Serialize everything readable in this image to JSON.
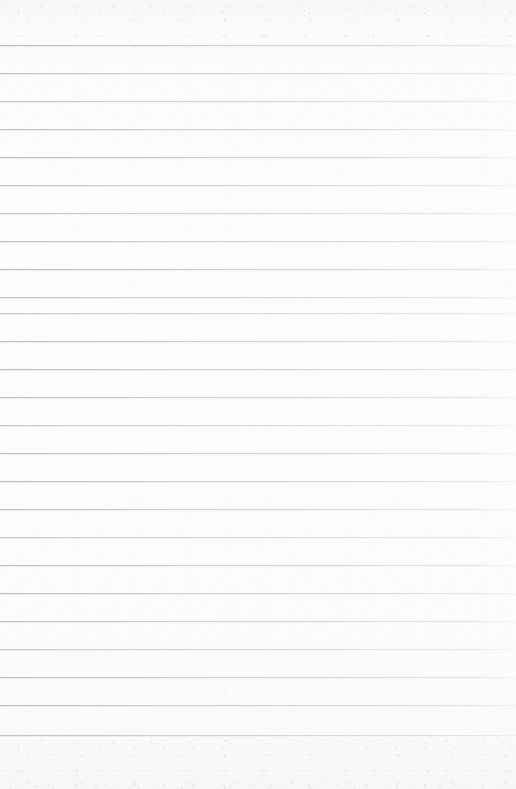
{
  "document": {
    "kind": "scanned-ruled-paper",
    "title": "Blank ruled notebook page",
    "text_content": "",
    "width": 516,
    "height": 789
  },
  "paper": {
    "background_color": "#fbfbfc",
    "edge_tint_color": "#f6f7f8",
    "has_texture": true,
    "texture_regions": [
      "top-margin",
      "bottom-margin"
    ]
  },
  "ruling": {
    "line_color": "#c5c9cd",
    "line_thickness_px": 1,
    "line_count": 25,
    "first_line_y": 45,
    "line_spacing_px": 28,
    "last_line_y": 735,
    "left_inset_px": 0,
    "right_inset_px": 0,
    "has_vertical_margin_rule": false,
    "line_y_positions": [
      45,
      73,
      101,
      129,
      157,
      185,
      213,
      241,
      269,
      297,
      313,
      341,
      369,
      397,
      425,
      453,
      481,
      509,
      537,
      565,
      593,
      621,
      649,
      677,
      705,
      735
    ]
  },
  "margins": {
    "top_margin_px": 45,
    "bottom_margin_px": 54
  }
}
